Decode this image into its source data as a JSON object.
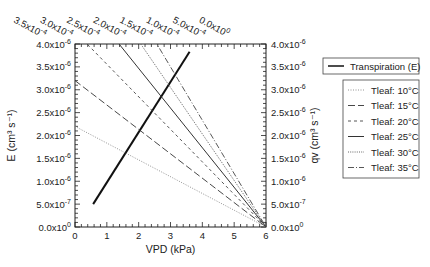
{
  "chart_data": {
    "type": "line",
    "title": "",
    "xlabel": "VPD (kPa)",
    "ylabel": "E (cm3 s-1)",
    "ylabel_right": "qv (cm3 s-1)",
    "xlim": [
      0,
      6
    ],
    "ylim": [
      0,
      4e-06
    ],
    "ylim_right": [
      0,
      4e-06
    ],
    "grid": false,
    "legend_position": "right-outside",
    "x_ticks": [
      "0",
      "1",
      "2",
      "3",
      "4",
      "5",
      "6"
    ],
    "y_ticks": [
      "0.0x10^0",
      "5.0x10^-7",
      "1.0x10^-6",
      "1.5x10^-6",
      "2.0x10^-6",
      "2.5x10^-6",
      "3.0x10^-6",
      "3.5x10^-6",
      "4.0x10^-6"
    ],
    "y_ticks_right": [
      "0.0x10^0",
      "5.0x10^-7",
      "1.0x10^-6",
      "1.5x10^-6",
      "2.0x10^-6",
      "2.5x10^-6",
      "3.0x10^-6",
      "3.5x10^-6",
      "4.0x10^-6"
    ],
    "top_axis_ticks": [
      "3.5x10^-4",
      "3.0x10^-4",
      "2.5x10^-4",
      "2.0x10^-4",
      "1.5x10^-4",
      "1.0x10^-4",
      "5.0x10^-4",
      "0.0x10^0"
    ],
    "series": [
      {
        "name": "Transpiration (E)",
        "style": "solid-thick",
        "x": [
          0.57,
          3.6
        ],
        "y": [
          5e-07,
          3.83e-06
        ]
      },
      {
        "name": "Tleaf: 10°C",
        "style": "dotted-light",
        "x": [
          0,
          6
        ],
        "y": [
          2.2e-06,
          0
        ]
      },
      {
        "name": "Tleaf: 15°C",
        "style": "long-dash",
        "x": [
          0,
          6
        ],
        "y": [
          3.2e-06,
          0
        ]
      },
      {
        "name": "Tleaf: 20°C",
        "style": "short-dash",
        "x": [
          0,
          6
        ],
        "y": [
          4.27e-06,
          0
        ]
      },
      {
        "name": "Tleaf: 25°C",
        "style": "solid",
        "x": [
          0,
          6
        ],
        "y": [
          5.2e-06,
          0
        ]
      },
      {
        "name": "Tleaf: 30°C",
        "style": "dotted",
        "x": [
          0,
          6
        ],
        "y": [
          6.1e-06,
          0
        ]
      },
      {
        "name": "Tleaf: 35°C",
        "style": "dash-dot",
        "x": [
          0,
          6
        ],
        "y": [
          7e-06,
          0
        ]
      }
    ]
  },
  "labels": {
    "xlabel": "VPD (kPa)",
    "ylabel_left": "E (cm³ s⁻¹)",
    "ylabel_right": "qv (cm³ s⁻¹)",
    "x_ticks": [
      "0",
      "1",
      "2",
      "3",
      "4",
      "5",
      "6"
    ],
    "y_ticks": [
      {
        "m": "0.0x10",
        "e": "0"
      },
      {
        "m": "5.0x10",
        "e": "-7"
      },
      {
        "m": "1.0x10",
        "e": "-6"
      },
      {
        "m": "1.5x10",
        "e": "-6"
      },
      {
        "m": "2.0x10",
        "e": "-6"
      },
      {
        "m": "2.5x10",
        "e": "-6"
      },
      {
        "m": "3.0x10",
        "e": "-6"
      },
      {
        "m": "3.5x10",
        "e": "-6"
      },
      {
        "m": "4.0x10",
        "e": "-6"
      }
    ],
    "top_ticks": [
      {
        "m": "3.5x10",
        "e": "-4"
      },
      {
        "m": "3.0x10",
        "e": "-4"
      },
      {
        "m": "2.5x10",
        "e": "-4"
      },
      {
        "m": "2.0x10",
        "e": "-4"
      },
      {
        "m": "1.5x10",
        "e": "-4"
      },
      {
        "m": "1.0x10",
        "e": "-4"
      },
      {
        "m": "5.0x10",
        "e": "-4"
      },
      {
        "m": "0.0x10",
        "e": "0"
      }
    ]
  },
  "legend": {
    "transpiration": "Transpiration (E)",
    "tleaf": [
      "Tleaf: 10°C",
      "Tleaf: 15°C",
      "Tleaf: 20°C",
      "Tleaf: 25°C",
      "Tleaf: 30°C",
      "Tleaf: 35°C"
    ]
  }
}
